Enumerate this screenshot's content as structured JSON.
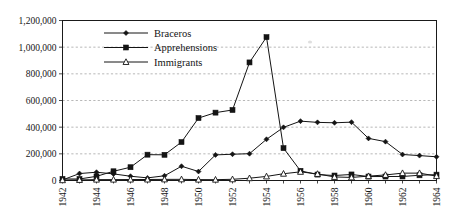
{
  "chart_data": {
    "type": "line",
    "title": "",
    "subtitle": "",
    "xlabel": "",
    "ylabel": "",
    "x": [
      1942,
      1943,
      1944,
      1945,
      1946,
      1947,
      1948,
      1949,
      1950,
      1951,
      1952,
      1953,
      1954,
      1955,
      1956,
      1957,
      1958,
      1959,
      1960,
      1961,
      1962,
      1963,
      1964
    ],
    "xtick_labels": [
      "1942",
      "1944",
      "1946",
      "1948",
      "1950",
      "1952",
      "1954",
      "1956",
      "1958",
      "1960",
      "1962",
      "1964"
    ],
    "xtick_values": [
      1942,
      1944,
      1946,
      1948,
      1950,
      1952,
      1954,
      1956,
      1958,
      1960,
      1962,
      1964
    ],
    "ytick_labels": [
      "0",
      "200,000",
      "400,000",
      "600,000",
      "800,000",
      "1,000,000",
      "1,200,000"
    ],
    "ytick_values": [
      0,
      200000,
      400000,
      600000,
      800000,
      1000000,
      1200000
    ],
    "ylim": [
      0,
      1200000
    ],
    "xlim": [
      1942,
      1964
    ],
    "grid": true,
    "grid_axis": "y",
    "legend_position": "top-center",
    "series": [
      {
        "name": "Braceros",
        "marker": "diamond",
        "marker_fill": "filled",
        "color": "#141414",
        "values": [
          4203,
          52098,
          62170,
          49454,
          32043,
          19632,
          35345,
          107000,
          67500,
          192000,
          197000,
          201000,
          309033,
          398650,
          445197,
          436049,
          432857,
          437643,
          315846,
          291420,
          194978,
          186865,
          177736
        ]
      },
      {
        "name": "Apprehensions",
        "marker": "square",
        "marker_fill": "filled",
        "color": "#141414",
        "values": [
          11784,
          11175,
          31174,
          69164,
          99591,
          193657,
          192779,
          288253,
          468339,
          509040,
          528815,
          885587,
          1075168,
          242608,
          72442,
          44451,
          37242,
          45336,
          29651,
          29817,
          30272,
          39124,
          43844
        ]
      },
      {
        "name": "Immigrants",
        "marker": "triangle",
        "marker_fill": "open",
        "color": "#141414",
        "values": [
          2378,
          4172,
          6598,
          6702,
          7146,
          7558,
          8384,
          8803,
          6744,
          6153,
          9079,
          17183,
          30645,
          50772,
          65047,
          49154,
          26712,
          23061,
          32684,
          41632,
          55291,
          55253,
          32967
        ]
      }
    ]
  },
  "legend": {
    "items": [
      {
        "label": "Braceros",
        "marker": "diamond-marker-icon"
      },
      {
        "label": "Apprehensions",
        "marker": "square-marker-icon"
      },
      {
        "label": "Immigrants",
        "marker": "triangle-marker-icon"
      }
    ]
  },
  "colors": {
    "ink": "#141414",
    "grid": "#9a9a9a",
    "background": "#ffffff"
  }
}
